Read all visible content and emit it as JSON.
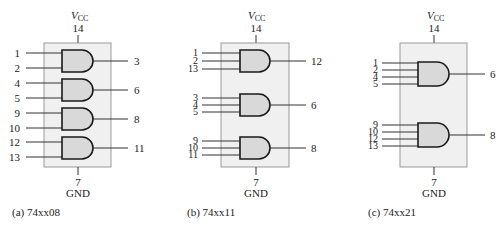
{
  "figures": [
    {
      "id": "a",
      "caption": "(a) 74xx08",
      "vcc_label": "V",
      "vcc_sub": "CC",
      "vcc_pin": "14",
      "gnd_pin": "7",
      "gnd_label": "GND",
      "gates": [
        {
          "inputs": [
            "1",
            "2"
          ],
          "output": "3"
        },
        {
          "inputs": [
            "4",
            "5"
          ],
          "output": "6"
        },
        {
          "inputs": [
            "9",
            "10"
          ],
          "output": "8"
        },
        {
          "inputs": [
            "12",
            "13"
          ],
          "output": "11"
        }
      ]
    },
    {
      "id": "b",
      "caption": "(b) 74xx11",
      "vcc_label": "V",
      "vcc_sub": "CC",
      "vcc_pin": "14",
      "gnd_pin": "7",
      "gnd_label": "GND",
      "gates": [
        {
          "inputs": [
            "1",
            "2",
            "13"
          ],
          "output": "12"
        },
        {
          "inputs": [
            "3",
            "4",
            "5"
          ],
          "output": "6"
        },
        {
          "inputs": [
            "9",
            "10",
            "11"
          ],
          "output": "8"
        }
      ]
    },
    {
      "id": "c",
      "caption": "(c) 74xx21",
      "vcc_label": "V",
      "vcc_sub": "CC",
      "vcc_pin": "14",
      "gnd_pin": "7",
      "gnd_label": "GND",
      "gates": [
        {
          "inputs": [
            "1",
            "2",
            "4",
            "5"
          ],
          "output": "6"
        },
        {
          "inputs": [
            "9",
            "10",
            "12",
            "13"
          ],
          "output": "8"
        }
      ]
    }
  ]
}
